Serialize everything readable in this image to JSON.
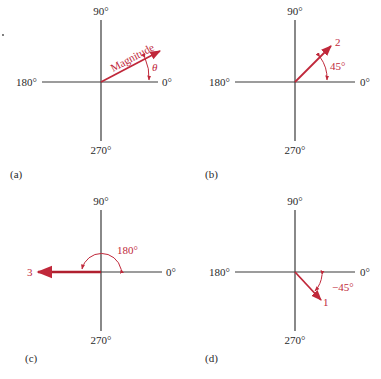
{
  "axis_labels": {
    "top": "90°",
    "left": "180°",
    "right": "0°",
    "bottom": "270°"
  },
  "colors": {
    "vector": "#c0283a",
    "axis": "#3a3a3a"
  },
  "panels": [
    {
      "caption": "(a)",
      "vector_label": "Magnitude",
      "angle_label": "θ",
      "angle_deg": 28
    },
    {
      "caption": "(b)",
      "vector_label": "2",
      "angle_label": "45°",
      "angle_deg": 45
    },
    {
      "caption": "(c)",
      "vector_label": "3",
      "angle_label": "180°",
      "angle_deg": 180
    },
    {
      "caption": "(d)",
      "vector_label": "1",
      "angle_label": "−45°",
      "angle_deg": -45
    }
  ]
}
